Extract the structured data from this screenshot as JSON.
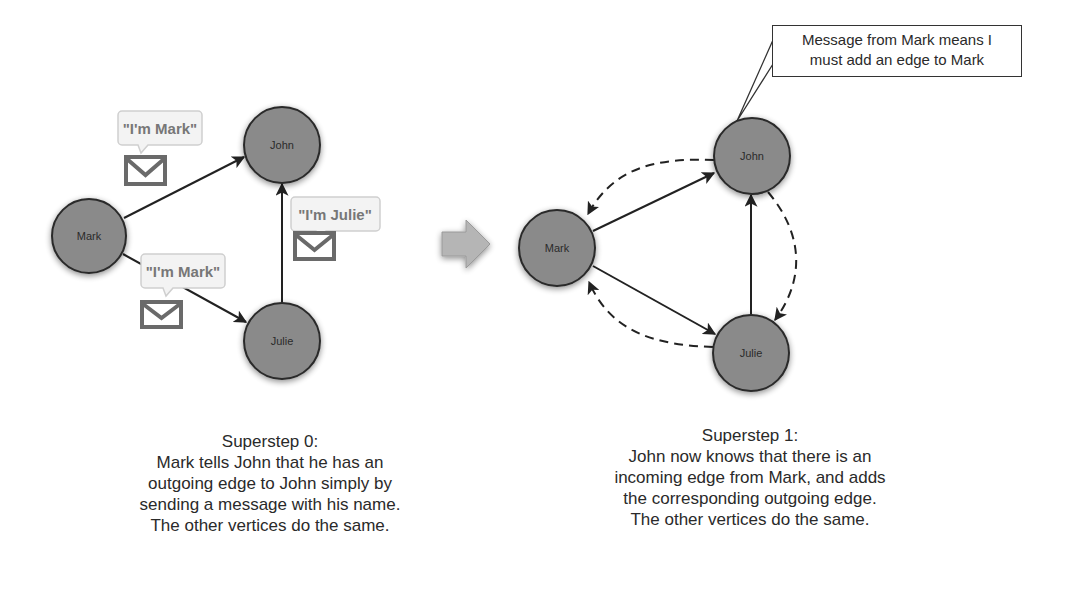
{
  "colors": {
    "node_fill": "#8a8a8a",
    "node_stroke": "#2a2a2a",
    "edge": "#222222",
    "bubble_fill": "#f3f3f3",
    "bubble_stroke": "#cfcfcf",
    "bubble_text": "#777777",
    "envelope": "#6a6a6a",
    "arrow_fill": "#b5b5b5"
  },
  "left_panel": {
    "nodes": [
      {
        "id": "mark",
        "label": "Mark",
        "cx": 89,
        "cy": 236,
        "r": 37
      },
      {
        "id": "john",
        "label": "John",
        "cx": 282,
        "cy": 145,
        "r": 38
      },
      {
        "id": "julie",
        "label": "Julie",
        "cx": 282,
        "cy": 341,
        "r": 38
      }
    ],
    "edges": [
      {
        "from": "Mark",
        "to": "John",
        "style": "solid"
      },
      {
        "from": "Mark",
        "to": "Julie",
        "style": "solid"
      },
      {
        "from": "Julie",
        "to": "John",
        "style": "solid"
      }
    ],
    "messages": [
      {
        "text": "\"I'm Mark\"",
        "icon": "envelope-icon"
      },
      {
        "text": "\"I'm Mark\"",
        "icon": "envelope-icon"
      },
      {
        "text": "\"I'm Julie\"",
        "icon": "envelope-icon"
      }
    ],
    "caption": {
      "title": "Superstep 0:",
      "lines": [
        "Mark tells John that he has an",
        "outgoing edge to John simply by",
        "sending a message with his name.",
        "The other vertices do the same."
      ]
    }
  },
  "transition_arrow": {
    "icon": "right-arrow-icon"
  },
  "right_panel": {
    "nodes": [
      {
        "id": "mark",
        "label": "Mark",
        "cx": 557,
        "cy": 248,
        "r": 38
      },
      {
        "id": "john",
        "label": "John",
        "cx": 752,
        "cy": 156,
        "r": 38
      },
      {
        "id": "julie",
        "label": "Julie",
        "cx": 751,
        "cy": 353,
        "r": 38
      }
    ],
    "edges": [
      {
        "from": "Mark",
        "to": "John",
        "style": "solid"
      },
      {
        "from": "Mark",
        "to": "Julie",
        "style": "solid"
      },
      {
        "from": "Julie",
        "to": "John",
        "style": "solid"
      },
      {
        "from": "John",
        "to": "Mark",
        "style": "dashed"
      },
      {
        "from": "Julie",
        "to": "Mark",
        "style": "dashed"
      },
      {
        "from": "John",
        "to": "Julie",
        "style": "dashed"
      }
    ],
    "callout": {
      "lines": [
        "Message from Mark means I",
        "must add an edge to Mark"
      ]
    },
    "caption": {
      "title": "Superstep 1:",
      "lines": [
        "John now knows that there is an",
        "incoming edge from Mark, and adds",
        "the corresponding outgoing edge.",
        "The other vertices do the same."
      ]
    }
  }
}
